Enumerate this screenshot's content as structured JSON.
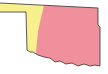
{
  "map": {
    "subject": "Oklahoma",
    "regions": [
      {
        "name": "west",
        "color": "#f8f08c"
      },
      {
        "name": "east",
        "color": "#f0909c"
      }
    ],
    "outline_color": "#333333",
    "background": "#ffffff"
  }
}
